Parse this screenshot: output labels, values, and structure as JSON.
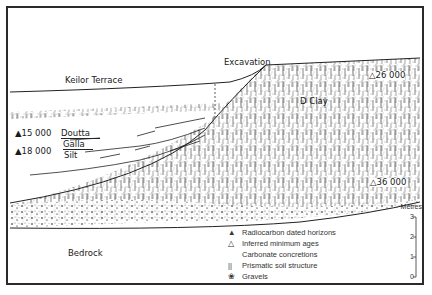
{
  "diagram": {
    "type": "geological cross-section",
    "labels": {
      "keilor_terrace": "Keilor  Terrace",
      "excavation": "Excavation",
      "d_clay": "D Clay",
      "doutta": "Doutta",
      "galla": "Galla",
      "silt": "Silt",
      "bedrock": "Bedrock"
    },
    "dates": {
      "radiocarbon_15000": "15 000",
      "radiocarbon_18000": "18 000",
      "inferred_26000": "26 000",
      "inferred_36000": "36 000"
    },
    "symbols": {
      "filled_triangle": "▲",
      "open_triangle": "△"
    },
    "legend": [
      {
        "symbol": "▲",
        "label": "Radiocarbon dated horizons"
      },
      {
        "symbol": "△",
        "label": "Inferred minimum ages"
      },
      {
        "symbol": "",
        "label": "Carbonate concretions"
      },
      {
        "symbol": "||",
        "label": "Prismatic soil structure"
      },
      {
        "symbol": "❀",
        "label": "Gravels"
      }
    ],
    "scale": {
      "title": "Metres",
      "ticks": [
        "3",
        "2",
        "1",
        "0"
      ]
    },
    "colors": {
      "ink": "#1a1a1a",
      "paper": "#ffffff",
      "stipple": "#444444"
    }
  }
}
